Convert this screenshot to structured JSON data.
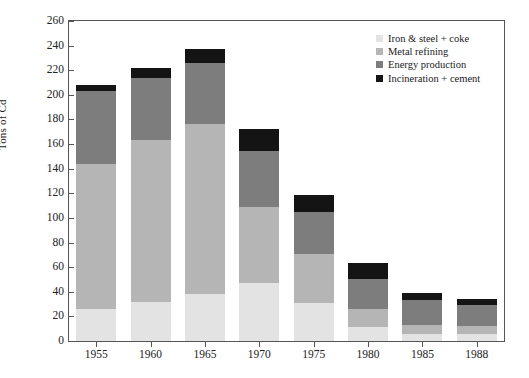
{
  "chart_data": {
    "type": "bar",
    "subtype": "stacked-bar",
    "title": "",
    "xlabel": "",
    "ylabel": "Tons of Cd",
    "ylim": [
      0,
      260
    ],
    "ytick_step": 20,
    "yticks": [
      0,
      20,
      40,
      60,
      80,
      100,
      120,
      140,
      160,
      180,
      200,
      220,
      240,
      260
    ],
    "grid": false,
    "legend_position": "top-right",
    "categories": [
      "1955",
      "1960",
      "1965",
      "1970",
      "1975",
      "1980",
      "1985",
      "1988"
    ],
    "series": [
      {
        "name": "Iron & steel + coke",
        "color": "#e3e3e3",
        "values": [
          26,
          32,
          38,
          47,
          31,
          11,
          6,
          6
        ]
      },
      {
        "name": "Metal refining",
        "color": "#b5b5b5",
        "values": [
          118,
          131,
          138,
          62,
          40,
          15,
          7,
          6
        ]
      },
      {
        "name": "Energy production",
        "color": "#7d7d7d",
        "values": [
          59,
          51,
          50,
          45,
          34,
          24,
          20,
          17
        ]
      },
      {
        "name": "Incineration + cement",
        "color": "#141414",
        "values": [
          5,
          8,
          11,
          18,
          14,
          13,
          6,
          5
        ]
      }
    ],
    "totals": [
      208,
      222,
      237,
      172,
      119,
      63,
      39,
      34
    ]
  },
  "legend": {
    "items": [
      {
        "label": "Iron & steel + coke",
        "color": "#e3e3e3"
      },
      {
        "label": "Metal refining",
        "color": "#b5b5b5"
      },
      {
        "label": "Energy production",
        "color": "#7d7d7d"
      },
      {
        "label": "Incineration + cement",
        "color": "#141414"
      }
    ]
  },
  "axes": {
    "y_title": "Tons of Cd"
  }
}
